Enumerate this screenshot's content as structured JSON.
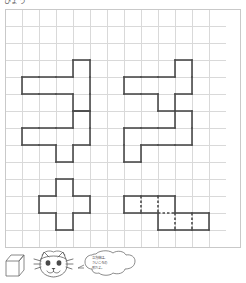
{
  "worksheet": {
    "header_text": "ひょう",
    "grid": {
      "columns": 13,
      "rows": 14,
      "cell_size": 17,
      "line_color": "#d9d9d9",
      "border_color": "#c9c9c9",
      "background": "#ffffff"
    },
    "shape_style": {
      "stroke_color": "#4a4a4a",
      "stroke_width": 1.6,
      "fill": "none",
      "dashed_stroke_color": "#4a4a4a"
    },
    "shapes": [
      {
        "id": "shape-top-left",
        "name": "t-pentomino-horizontal-left",
        "label": "Shape 1",
        "cells": [
          [
            1,
            4
          ],
          [
            2,
            4
          ],
          [
            3,
            4
          ],
          [
            4,
            3
          ],
          [
            4,
            4
          ],
          [
            4,
            5
          ]
        ],
        "has_internal_dashes": false
      },
      {
        "id": "shape-top-right",
        "name": "s-hexomino-top-right",
        "label": "Shape 2",
        "cells": [
          [
            7,
            4
          ],
          [
            8,
            4
          ],
          [
            9,
            4
          ],
          [
            10,
            3
          ],
          [
            10,
            4
          ],
          [
            9,
            5
          ]
        ],
        "has_internal_dashes": false
      },
      {
        "id": "shape-middle-left",
        "name": "s-hexomino-middle-left",
        "label": "Shape 3",
        "cells": [
          [
            1,
            7
          ],
          [
            2,
            7
          ],
          [
            3,
            7
          ],
          [
            4,
            6
          ],
          [
            4,
            7
          ],
          [
            3,
            8
          ]
        ],
        "has_internal_dashes": false
      },
      {
        "id": "shape-middle-right",
        "name": "z-hexomino-middle-right",
        "label": "Shape 4",
        "cells": [
          [
            7,
            7
          ],
          [
            8,
            7
          ],
          [
            9,
            7
          ],
          [
            10,
            6
          ],
          [
            10,
            7
          ],
          [
            7,
            8
          ]
        ],
        "has_internal_dashes": false
      },
      {
        "id": "shape-bottom-left",
        "name": "plus-pentomino-bottom-left",
        "label": "Shape 5",
        "cells": [
          [
            3,
            10
          ],
          [
            2,
            11
          ],
          [
            3,
            11
          ],
          [
            4,
            11
          ],
          [
            3,
            12
          ]
        ],
        "has_internal_dashes": false
      },
      {
        "id": "shape-bottom-right",
        "name": "offset-bars-hexomino-dashed",
        "label": "Shape 6",
        "cells": [
          [
            7,
            11
          ],
          [
            8,
            11
          ],
          [
            9,
            11
          ],
          [
            9,
            12
          ],
          [
            10,
            12
          ],
          [
            11,
            12
          ]
        ],
        "has_internal_dashes": true
      }
    ]
  },
  "illustration": {
    "cube": {
      "name": "cube-diagram",
      "stroke_color": "#6b6b6b"
    },
    "character": {
      "name": "cat-character",
      "stroke_color": "#5a5a5a"
    },
    "speech_bubble": {
      "name": "speech-bubble",
      "lines": [
        "立方体は、",
        "さいころの",
        "形だよ。"
      ],
      "stroke_color": "#5a5a5a"
    }
  }
}
